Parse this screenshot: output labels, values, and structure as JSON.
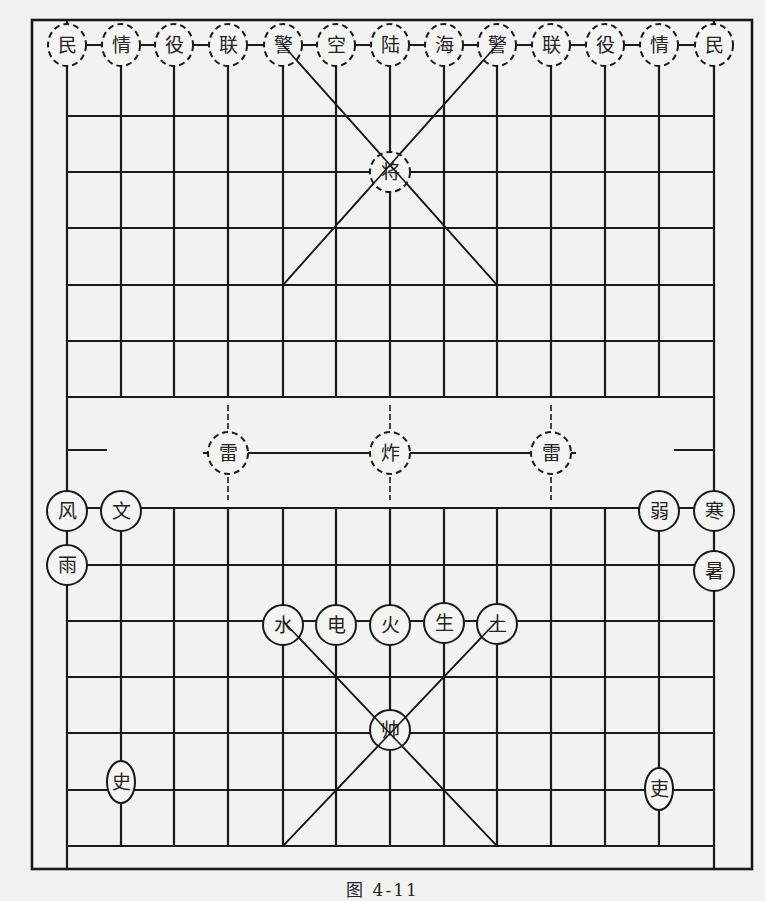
{
  "figure": {
    "caption": "图 4-11",
    "colors": {
      "line": "#1a1a1a",
      "background": "#f2f2f0",
      "piece_fill": "#f4f4f2"
    }
  },
  "grid": {
    "columns_x": [
      67,
      121,
      174,
      228,
      283,
      336,
      390,
      444,
      497,
      551,
      605,
      659,
      714
    ],
    "top_rows_y": [
      45,
      116,
      172,
      228,
      285,
      341,
      397
    ],
    "river_y": 453,
    "bottom_rows_y": [
      508,
      565,
      621,
      677,
      733,
      790,
      846
    ],
    "frame": {
      "x": 32,
      "y": 20,
      "w": 720,
      "h": 849
    }
  },
  "top_side": {
    "style": "dashed",
    "back_row": [
      {
        "label": "民",
        "col": 0
      },
      {
        "label": "情",
        "col": 1
      },
      {
        "label": "役",
        "col": 2
      },
      {
        "label": "联",
        "col": 3
      },
      {
        "label": "警",
        "col": 4
      },
      {
        "label": "空",
        "col": 5
      },
      {
        "label": "陆",
        "col": 6
      },
      {
        "label": "海",
        "col": 7
      },
      {
        "label": "警",
        "col": 8
      },
      {
        "label": "联",
        "col": 9
      },
      {
        "label": "役",
        "col": 10
      },
      {
        "label": "情",
        "col": 11
      },
      {
        "label": "民",
        "col": 12
      }
    ],
    "general": {
      "label": "将",
      "col": 6,
      "y": 172
    }
  },
  "river": {
    "pieces": [
      {
        "label": "雷",
        "col": 3
      },
      {
        "label": "炸",
        "col": 6
      },
      {
        "label": "雷",
        "col": 9
      }
    ]
  },
  "bottom_side": {
    "style": "solid",
    "pieces": [
      {
        "label": "风",
        "x": 67,
        "y": 511
      },
      {
        "label": "文",
        "x": 121,
        "y": 511
      },
      {
        "label": "雨",
        "x": 67,
        "y": 565
      },
      {
        "label": "弱",
        "x": 659,
        "y": 511
      },
      {
        "label": "寒",
        "x": 714,
        "y": 511
      },
      {
        "label": "暑",
        "x": 714,
        "y": 571
      },
      {
        "label": "水",
        "x": 283,
        "y": 625
      },
      {
        "label": "电",
        "x": 336,
        "y": 625
      },
      {
        "label": "火",
        "x": 390,
        "y": 625
      },
      {
        "label": "生",
        "x": 444,
        "y": 623
      },
      {
        "label": "土",
        "x": 497,
        "y": 624
      },
      {
        "label": "帅",
        "x": 390,
        "y": 730
      },
      {
        "label": "史",
        "x": 121,
        "y": 782
      },
      {
        "label": "吏",
        "x": 659,
        "y": 789
      }
    ]
  }
}
